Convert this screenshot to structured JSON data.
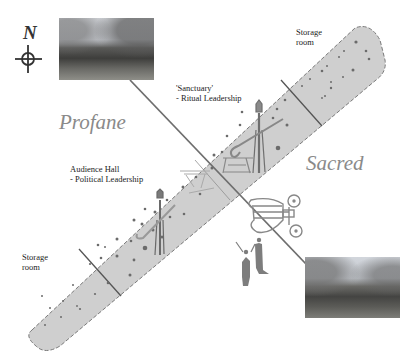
{
  "compass": {
    "label": "N"
  },
  "zones": {
    "profane": "Profane",
    "sacred": "Sacred"
  },
  "rooms": {
    "storage_ne": {
      "line1": "Storage",
      "line2": "room"
    },
    "sanctuary": {
      "line1": "'Sanctuary'",
      "line2": "- Ritual Leadership"
    },
    "audience_hall": {
      "line1": "Audience Hall",
      "line2": "- Political Leadership"
    },
    "storage_sw": {
      "line1": "Storage",
      "line2": "room"
    }
  },
  "photos": [
    {
      "name": "photo-stone-ruin-northwest",
      "description": "stone wall ruin with trees"
    },
    {
      "name": "photo-stone-ruin-southeast",
      "description": "stone wall ruin with trees"
    }
  ],
  "colors": {
    "band_fill": "#cfcfcf",
    "band_border": "#7a7a7a",
    "axis_line": "#6e6e6e",
    "zone_text": "#8a8a8a",
    "figure": "#7d7d7d"
  }
}
